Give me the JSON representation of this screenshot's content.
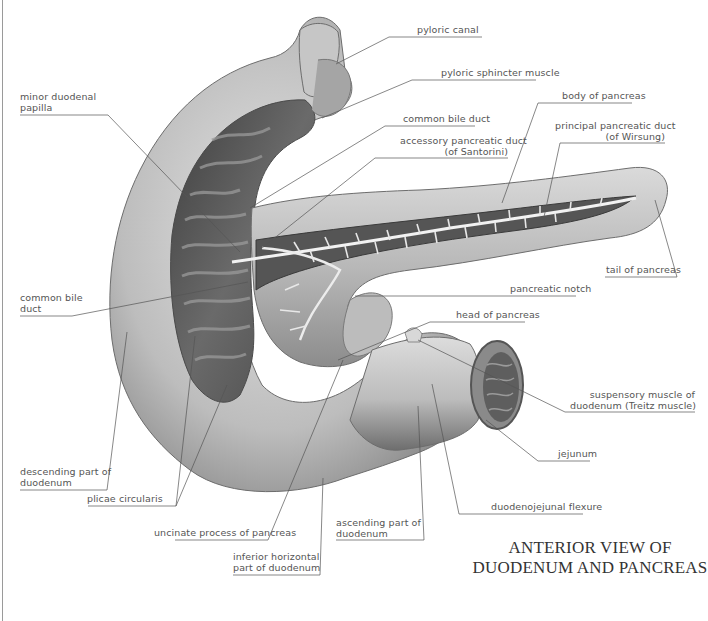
{
  "title": {
    "line1": "ANTERIOR VIEW OF",
    "line2": "DUODENUM AND PANCREAS"
  },
  "labels": {
    "pyloric_canal": "pyloric canal",
    "pyloric_sphincter": "pyloric sphincter muscle",
    "minor_papilla_1": "minor duodenal",
    "minor_papilla_2": "papilla",
    "common_bile_duct_top": "common bile duct",
    "body_of_pancreas": "body of pancreas",
    "accessory_duct_1": "accessory pancreatic duct",
    "accessory_duct_2": "(of Santorini)",
    "principal_duct_1": "principal pancreatic duct",
    "principal_duct_2": "(of Wirsung)",
    "tail_of_pancreas": "tail of pancreas",
    "common_bile_duct_left_1": "common bile",
    "common_bile_duct_left_2": "duct",
    "pancreatic_notch": "pancreatic notch",
    "head_of_pancreas": "head of pancreas",
    "suspensory_muscle_1": "suspensory muscle of",
    "suspensory_muscle_2": "duodenum (Treitz muscle)",
    "jejunum": "jejunum",
    "descending_part_1": "descending part of",
    "descending_part_2": "duodenum",
    "plicae_circularis": "plicae circularis",
    "duodenojejunal_flexure": "duodenojejunal flexure",
    "uncinate_process": "uncinate process of pancreas",
    "ascending_part_1": "ascending part of",
    "ascending_part_2": "duodenum",
    "inferior_horizontal_1": "inferior horizontal",
    "inferior_horizontal_2": "part of duodenum"
  },
  "colors": {
    "organ_light": "#d2d2d2",
    "organ_mid": "#a8a8a8",
    "organ_dark": "#5a5a5a",
    "duct": "#f2f2f2",
    "leader": "#555555",
    "text": "#555555"
  }
}
